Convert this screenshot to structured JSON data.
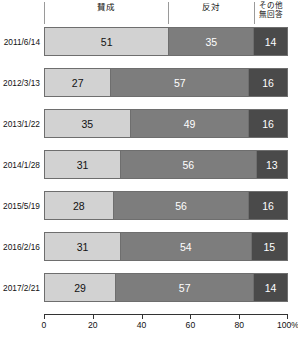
{
  "chart_data": {
    "type": "bar",
    "subtype": "horizontal-stacked-100",
    "title": "",
    "xlabel": "",
    "ylabel": "",
    "xlim": [
      0,
      100
    ],
    "grid": false,
    "legend_position": "top",
    "categories": [
      "2011/6/14",
      "2012/3/13",
      "2013/1/22",
      "2014/1/28",
      "2015/5/19",
      "2016/2/16",
      "2017/2/21"
    ],
    "series": [
      {
        "name": "賛成",
        "color": "#d2d2d2",
        "values": [
          51,
          27,
          35,
          31,
          28,
          31,
          29
        ]
      },
      {
        "name": "反対",
        "color": "#7d7d7d",
        "values": [
          35,
          57,
          49,
          56,
          56,
          54,
          57
        ]
      },
      {
        "name": "その他\n無回答",
        "color": "#4a4a4a",
        "values": [
          14,
          16,
          16,
          13,
          16,
          15,
          14
        ]
      }
    ],
    "xticks": [
      0,
      20,
      40,
      60,
      80,
      100
    ],
    "xticklabels": [
      "0",
      "20",
      "40",
      "60",
      "80",
      "100%"
    ]
  },
  "header": {
    "col1": "賛成",
    "col2": "反対",
    "col3_line1": "その他",
    "col3_line2": "無回答",
    "sep1_pct": 51,
    "sep2_pct": 86
  },
  "rows": [
    {
      "label": "2011/6/14",
      "approve": "51",
      "oppose": "35",
      "other": "14",
      "approve_pct": 51,
      "oppose_pct": 35,
      "other_pct": 14
    },
    {
      "label": "2012/3/13",
      "approve": "27",
      "oppose": "57",
      "other": "16",
      "approve_pct": 27,
      "oppose_pct": 57,
      "other_pct": 16
    },
    {
      "label": "2013/1/22",
      "approve": "35",
      "oppose": "49",
      "other": "16",
      "approve_pct": 35,
      "oppose_pct": 49,
      "other_pct": 16
    },
    {
      "label": "2014/1/28",
      "approve": "31",
      "oppose": "56",
      "other": "13",
      "approve_pct": 31,
      "oppose_pct": 56,
      "other_pct": 13
    },
    {
      "label": "2015/5/19",
      "approve": "28",
      "oppose": "56",
      "other": "16",
      "approve_pct": 28,
      "oppose_pct": 56,
      "other_pct": 16
    },
    {
      "label": "2016/2/16",
      "approve": "31",
      "oppose": "54",
      "other": "15",
      "approve_pct": 31,
      "oppose_pct": 54,
      "other_pct": 15
    },
    {
      "label": "2017/2/21",
      "approve": "29",
      "oppose": "57",
      "other": "14",
      "approve_pct": 29,
      "oppose_pct": 57,
      "other_pct": 14
    }
  ],
  "axis": {
    "ticks": [
      "0",
      "20",
      "40",
      "60",
      "80",
      "100%"
    ],
    "positions": [
      0,
      20,
      40,
      60,
      80,
      100
    ]
  },
  "colors": {
    "approve": "#d2d2d2",
    "oppose": "#7d7d7d",
    "other": "#4a4a4a",
    "border": "#6e6e6e",
    "axis": "#333333"
  }
}
